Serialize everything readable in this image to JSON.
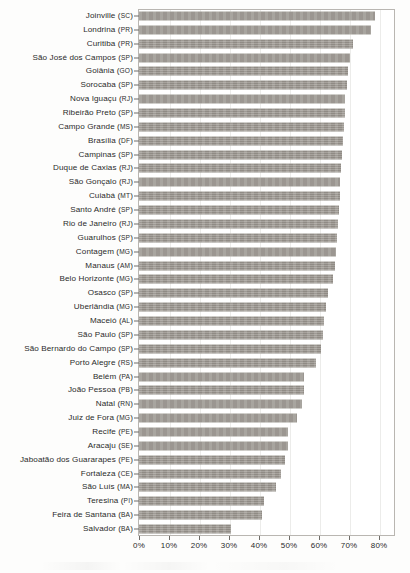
{
  "chart_data": {
    "type": "bar",
    "orientation": "horizontal",
    "title": "",
    "subtitle": "",
    "xlabel": "",
    "ylabel": "",
    "xlim": [
      0,
      85
    ],
    "xticks": [
      0,
      10,
      20,
      30,
      40,
      50,
      60,
      70,
      80
    ],
    "xtick_labels": [
      "0%",
      "10%",
      "20%",
      "30%",
      "40%",
      "50%",
      "60%",
      "70%",
      "80%"
    ],
    "grid": false,
    "legend": null,
    "value_unit": "%",
    "bar_color": "#9a958e",
    "axis_color": "#6f6c68",
    "categories": [
      "Joinville (SC)",
      "Londrina (PR)",
      "Curitiba (PR)",
      "São José dos Campos (SP)",
      "Goiânia (GO)",
      "Sorocaba (SP)",
      "Nova Iguaçu (RJ)",
      "Ribeirão Preto (SP)",
      "Campo Grande (MS)",
      "Brasília (DF)",
      "Campinas (SP)",
      "Duque de Caxias (RJ)",
      "São Gonçalo (RJ)",
      "Cuiabá (MT)",
      "Santo André (SP)",
      "Rio de Janeiro (RJ)",
      "Guarulhos (SP)",
      "Contagem (MG)",
      "Manaus (AM)",
      "Belo Horizonte (MG)",
      "Osasco (SP)",
      "Uberlândia (MG)",
      "Maceió (AL)",
      "São Paulo (SP)",
      "São Bernardo do Campo (SP)",
      "Porto Alegre (RS)",
      "Belém (PA)",
      "João Pessoa (PB)",
      "Natal (RN)",
      "Juiz de Fora (MG)",
      "Recife (PE)",
      "Aracaju (SE)",
      "Jaboatão dos Guararapes (PE)",
      "Fortaleza (CE)",
      "São Luís (MA)",
      "Teresina (PI)",
      "Feira de Santana (BA)",
      "Salvador (BA)"
    ],
    "values": [
      78.8,
      77.4,
      71.3,
      70.4,
      69.6,
      69.3,
      68.7,
      68.5,
      68.2,
      67.9,
      67.6,
      67.3,
      67.1,
      66.9,
      66.6,
      66.3,
      66.0,
      65.7,
      65.2,
      64.5,
      63.0,
      62.3,
      61.5,
      61.2,
      60.6,
      58.9,
      55.1,
      55.0,
      54.4,
      52.7,
      49.7,
      49.7,
      48.6,
      47.2,
      45.5,
      41.6,
      40.9,
      30.6
    ],
    "cities": [
      {
        "name": "Joinville",
        "uf": "SC",
        "value": 78.8
      },
      {
        "name": "Londrina",
        "uf": "PR",
        "value": 77.4
      },
      {
        "name": "Curitiba",
        "uf": "PR",
        "value": 71.3
      },
      {
        "name": "São José dos Campos",
        "uf": "SP",
        "value": 70.4
      },
      {
        "name": "Goiânia",
        "uf": "GO",
        "value": 69.6
      },
      {
        "name": "Sorocaba",
        "uf": "SP",
        "value": 69.3
      },
      {
        "name": "Nova Iguaçu",
        "uf": "RJ",
        "value": 68.7
      },
      {
        "name": "Ribeirão Preto",
        "uf": "SP",
        "value": 68.5
      },
      {
        "name": "Campo Grande",
        "uf": "MS",
        "value": 68.2
      },
      {
        "name": "Brasília",
        "uf": "DF",
        "value": 67.9
      },
      {
        "name": "Campinas",
        "uf": "SP",
        "value": 67.6
      },
      {
        "name": "Duque de Caxias",
        "uf": "RJ",
        "value": 67.3
      },
      {
        "name": "São Gonçalo",
        "uf": "RJ",
        "value": 67.1
      },
      {
        "name": "Cuiabá",
        "uf": "MT",
        "value": 66.9
      },
      {
        "name": "Santo André",
        "uf": "SP",
        "value": 66.6
      },
      {
        "name": "Rio de Janeiro",
        "uf": "RJ",
        "value": 66.3
      },
      {
        "name": "Guarulhos",
        "uf": "SP",
        "value": 66.0
      },
      {
        "name": "Contagem",
        "uf": "MG",
        "value": 65.7
      },
      {
        "name": "Manaus",
        "uf": "AM",
        "value": 65.2
      },
      {
        "name": "Belo Horizonte",
        "uf": "MG",
        "value": 64.5
      },
      {
        "name": "Osasco",
        "uf": "SP",
        "value": 63.0
      },
      {
        "name": "Uberlândia",
        "uf": "MG",
        "value": 62.3
      },
      {
        "name": "Maceió",
        "uf": "AL",
        "value": 61.5
      },
      {
        "name": "São Paulo",
        "uf": "SP",
        "value": 61.2
      },
      {
        "name": "São Bernardo do Campo",
        "uf": "SP",
        "value": 60.6
      },
      {
        "name": "Porto Alegre",
        "uf": "RS",
        "value": 58.9
      },
      {
        "name": "Belém",
        "uf": "PA",
        "value": 55.1
      },
      {
        "name": "João Pessoa",
        "uf": "PB",
        "value": 55.0
      },
      {
        "name": "Natal",
        "uf": "RN",
        "value": 54.4
      },
      {
        "name": "Juiz de Fora",
        "uf": "MG",
        "value": 52.7
      },
      {
        "name": "Recife",
        "uf": "PE",
        "value": 49.7
      },
      {
        "name": "Aracaju",
        "uf": "SE",
        "value": 49.7
      },
      {
        "name": "Jaboatão dos Guararapes",
        "uf": "PE",
        "value": 48.6
      },
      {
        "name": "Fortaleza",
        "uf": "CE",
        "value": 47.2
      },
      {
        "name": "São Luís",
        "uf": "MA",
        "value": 45.5
      },
      {
        "name": "Teresina",
        "uf": "PI",
        "value": 41.6
      },
      {
        "name": "Feira de Santana",
        "uf": "BA",
        "value": 40.9
      },
      {
        "name": "Salvador",
        "uf": "BA",
        "value": 30.6
      }
    ]
  }
}
